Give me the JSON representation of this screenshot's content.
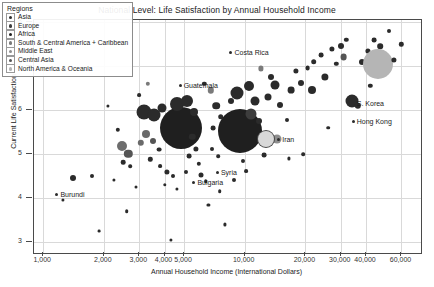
{
  "chart_data": {
    "type": "scatter",
    "title": "National Level: Life Satisfaction by Annual Household Income",
    "xlabel": "Annual Household Income (International Dollars)",
    "ylabel": "Current Life Satisfaction",
    "xscale": "log",
    "xlim": [
      900,
      75000
    ],
    "ylim": [
      2.75,
      8.05
    ],
    "grid": true,
    "legend_position": "top-left",
    "legend_title": "Regions",
    "xticks": [
      {
        "value": 1000,
        "label": "1,000"
      },
      {
        "value": 2000,
        "label": "2,000"
      },
      {
        "value": 3000,
        "label": "3,000"
      },
      {
        "value": 4000,
        "label": "4,000"
      },
      {
        "value": 5000,
        "label": "5,000"
      },
      {
        "value": 10000,
        "label": "10,000"
      },
      {
        "value": 20000,
        "label": "20,000"
      },
      {
        "value": 30000,
        "label": "30,000"
      },
      {
        "value": 40000,
        "label": "40,000"
      },
      {
        "value": 60000,
        "label": "60,000"
      }
    ],
    "yticks": [
      {
        "value": 3,
        "label": "3"
      },
      {
        "value": 4,
        "label": "4"
      },
      {
        "value": 5,
        "label": "5"
      },
      {
        "value": 6,
        "label": "6"
      },
      {
        "value": 7,
        "label": "7"
      },
      {
        "value": 8,
        "label": "8"
      }
    ],
    "series": [
      {
        "name": "Asia",
        "color": "#2b2b2b"
      },
      {
        "name": "Europe",
        "color": "#3d3d3d"
      },
      {
        "name": "Africa",
        "color": "#1f1f1f"
      },
      {
        "name": "South & Central America + Caribbean",
        "color": "#7a7a7a"
      },
      {
        "name": "Middle East",
        "color": "#8d8d8d"
      },
      {
        "name": "Central Asia",
        "color": "#555555"
      },
      {
        "name": "North America & Oceania",
        "color": "#b5b5b5"
      }
    ],
    "annotations": [
      {
        "label": "Costa Rica",
        "x": 8400,
        "y": 7.3
      },
      {
        "label": "Guatemala",
        "x": 4700,
        "y": 6.55
      },
      {
        "label": "S. Korea",
        "x": 34000,
        "y": 6.15
      },
      {
        "label": "Hong Kong",
        "x": 34000,
        "y": 5.72
      },
      {
        "label": "Iran",
        "x": 14500,
        "y": 5.32
      },
      {
        "label": "Syria",
        "x": 7200,
        "y": 4.56
      },
      {
        "label": "Bulgaria",
        "x": 5500,
        "y": 4.35
      },
      {
        "label": "Burundi",
        "x": 1150,
        "y": 4.08
      }
    ],
    "points": [
      {
        "x": 1400,
        "y": 4.45,
        "r": 3.0,
        "c": "#2b2b2b"
      },
      {
        "x": 1750,
        "y": 4.5,
        "r": 2.0,
        "c": "#2b2b2b"
      },
      {
        "x": 1250,
        "y": 3.95,
        "r": 1.6,
        "c": "#2b2b2b"
      },
      {
        "x": 2350,
        "y": 5.55,
        "r": 2.2,
        "c": "#2b2b2b"
      },
      {
        "x": 2450,
        "y": 5.18,
        "r": 5.0,
        "c": "#6d6d6d"
      },
      {
        "x": 2650,
        "y": 5.0,
        "r": 4.2,
        "c": "#555555"
      },
      {
        "x": 2500,
        "y": 4.82,
        "r": 2.3,
        "c": "#2b2b2b"
      },
      {
        "x": 2700,
        "y": 4.72,
        "r": 1.8,
        "c": "#2b2b2b"
      },
      {
        "x": 2250,
        "y": 4.42,
        "r": 1.6,
        "c": "#2b2b2b"
      },
      {
        "x": 2900,
        "y": 4.25,
        "r": 1.5,
        "c": "#2b2b2b"
      },
      {
        "x": 2600,
        "y": 3.7,
        "r": 1.8,
        "c": "#2b2b2b"
      },
      {
        "x": 2100,
        "y": 6.1,
        "r": 1.6,
        "c": "#2b2b2b"
      },
      {
        "x": 3000,
        "y": 6.35,
        "r": 1.9,
        "c": "#2b2b2b"
      },
      {
        "x": 3300,
        "y": 6.6,
        "r": 2.2,
        "c": "#7a7a7a"
      },
      {
        "x": 3150,
        "y": 5.95,
        "r": 7.5,
        "c": "#2b2b2b"
      },
      {
        "x": 3550,
        "y": 5.9,
        "r": 6.5,
        "c": "#2b2b2b"
      },
      {
        "x": 3900,
        "y": 6.05,
        "r": 4.5,
        "c": "#2b2b2b"
      },
      {
        "x": 3250,
        "y": 5.45,
        "r": 4.0,
        "c": "#6a6a6a"
      },
      {
        "x": 3050,
        "y": 5.25,
        "r": 3.2,
        "c": "#6a6a6a"
      },
      {
        "x": 3500,
        "y": 5.3,
        "r": 3.0,
        "c": "#555555"
      },
      {
        "x": 3750,
        "y": 5.1,
        "r": 2.4,
        "c": "#2b2b2b"
      },
      {
        "x": 3400,
        "y": 4.88,
        "r": 2.2,
        "c": "#2b2b2b"
      },
      {
        "x": 3800,
        "y": 4.72,
        "r": 1.9,
        "c": "#2b2b2b"
      },
      {
        "x": 4100,
        "y": 4.6,
        "r": 2.6,
        "c": "#2b2b2b"
      },
      {
        "x": 4400,
        "y": 4.5,
        "r": 2.0,
        "c": "#2b2b2b"
      },
      {
        "x": 4000,
        "y": 4.3,
        "r": 1.7,
        "c": "#2b2b2b"
      },
      {
        "x": 4600,
        "y": 4.2,
        "r": 1.6,
        "c": "#2b2b2b"
      },
      {
        "x": 4850,
        "y": 5.6,
        "r": 21.0,
        "c": "#1f1f1f"
      },
      {
        "x": 4600,
        "y": 6.15,
        "r": 7.0,
        "c": "#2b2b2b"
      },
      {
        "x": 5200,
        "y": 6.2,
        "r": 6.0,
        "c": "#2b2b2b"
      },
      {
        "x": 5600,
        "y": 5.95,
        "r": 4.0,
        "c": "#2b2b2b"
      },
      {
        "x": 5500,
        "y": 5.4,
        "r": 3.2,
        "c": "#2b2b2b"
      },
      {
        "x": 5700,
        "y": 5.12,
        "r": 2.6,
        "c": "#2b2b2b"
      },
      {
        "x": 5300,
        "y": 4.95,
        "r": 2.4,
        "c": "#2b2b2b"
      },
      {
        "x": 5900,
        "y": 4.78,
        "r": 2.2,
        "c": "#2b2b2b"
      },
      {
        "x": 5100,
        "y": 4.6,
        "r": 2.0,
        "c": "#2b2b2b"
      },
      {
        "x": 6100,
        "y": 4.52,
        "r": 2.5,
        "c": "#2b2b2b"
      },
      {
        "x": 6400,
        "y": 4.38,
        "r": 1.8,
        "c": "#2b2b2b"
      },
      {
        "x": 6800,
        "y": 6.45,
        "r": 3.2,
        "c": "#7a7a7a"
      },
      {
        "x": 6300,
        "y": 6.6,
        "r": 2.2,
        "c": "#2b2b2b"
      },
      {
        "x": 7200,
        "y": 6.1,
        "r": 3.8,
        "c": "#2b2b2b"
      },
      {
        "x": 7600,
        "y": 5.85,
        "r": 2.8,
        "c": "#2b2b2b"
      },
      {
        "x": 7000,
        "y": 5.6,
        "r": 2.4,
        "c": "#2b2b2b"
      },
      {
        "x": 7900,
        "y": 5.35,
        "r": 2.2,
        "c": "#2b2b2b"
      },
      {
        "x": 6900,
        "y": 5.12,
        "r": 2.0,
        "c": "#2b2b2b"
      },
      {
        "x": 7400,
        "y": 4.95,
        "r": 1.8,
        "c": "#2b2b2b"
      },
      {
        "x": 9500,
        "y": 5.52,
        "r": 22.0,
        "c": "#1f1f1f"
      },
      {
        "x": 9200,
        "y": 6.4,
        "r": 6.5,
        "c": "#2b2b2b"
      },
      {
        "x": 10500,
        "y": 6.55,
        "r": 5.0,
        "c": "#2b2b2b"
      },
      {
        "x": 8600,
        "y": 6.2,
        "r": 3.0,
        "c": "#2b2b2b"
      },
      {
        "x": 11200,
        "y": 6.2,
        "r": 4.5,
        "c": "#2b2b2b"
      },
      {
        "x": 10800,
        "y": 5.92,
        "r": 5.5,
        "c": "#3d3d3d"
      },
      {
        "x": 11800,
        "y": 5.75,
        "r": 3.0,
        "c": "#2b2b2b"
      },
      {
        "x": 9800,
        "y": 4.85,
        "r": 2.0,
        "c": "#2b2b2b"
      },
      {
        "x": 10200,
        "y": 4.62,
        "r": 1.9,
        "c": "#2b2b2b"
      },
      {
        "x": 8800,
        "y": 4.42,
        "r": 2.0,
        "c": "#2b2b2b"
      },
      {
        "x": 12500,
        "y": 4.98,
        "r": 2.4,
        "c": "#2b2b2b"
      },
      {
        "x": 12000,
        "y": 6.95,
        "r": 2.6,
        "c": "#7a7a7a"
      },
      {
        "x": 13500,
        "y": 6.75,
        "r": 3.0,
        "c": "#2b2b2b"
      },
      {
        "x": 14200,
        "y": 6.58,
        "r": 4.5,
        "c": "#2b2b2b"
      },
      {
        "x": 13000,
        "y": 6.3,
        "r": 3.5,
        "c": "#2b2b2b"
      },
      {
        "x": 15000,
        "y": 6.12,
        "r": 3.0,
        "c": "#2b2b2b"
      },
      {
        "x": 14500,
        "y": 5.35,
        "r": 4.5,
        "c": "#8d8d8d"
      },
      {
        "x": 16200,
        "y": 5.78,
        "r": 2.0,
        "c": "#2b2b2b"
      },
      {
        "x": 17000,
        "y": 6.45,
        "r": 3.4,
        "c": "#2b2b2b"
      },
      {
        "x": 18000,
        "y": 6.9,
        "r": 2.6,
        "c": "#2b2b2b"
      },
      {
        "x": 19000,
        "y": 6.62,
        "r": 3.0,
        "c": "#2b2b2b"
      },
      {
        "x": 20500,
        "y": 6.95,
        "r": 2.4,
        "c": "#2b2b2b"
      },
      {
        "x": 22000,
        "y": 7.1,
        "r": 2.8,
        "c": "#2b2b2b"
      },
      {
        "x": 24000,
        "y": 7.25,
        "r": 2.4,
        "c": "#2b2b2b"
      },
      {
        "x": 21500,
        "y": 6.45,
        "r": 4.0,
        "c": "#2b2b2b"
      },
      {
        "x": 25000,
        "y": 6.75,
        "r": 3.6,
        "c": "#2b2b2b"
      },
      {
        "x": 27000,
        "y": 7.4,
        "r": 2.6,
        "c": "#2b2b2b"
      },
      {
        "x": 28500,
        "y": 7.05,
        "r": 2.2,
        "c": "#2b2b2b"
      },
      {
        "x": 30000,
        "y": 7.45,
        "r": 3.0,
        "c": "#2b2b2b"
      },
      {
        "x": 32000,
        "y": 7.6,
        "r": 2.2,
        "c": "#2b2b2b"
      },
      {
        "x": 31000,
        "y": 7.2,
        "r": 3.4,
        "c": "#555555"
      },
      {
        "x": 34000,
        "y": 6.2,
        "r": 6.5,
        "c": "#2b2b2b"
      },
      {
        "x": 36500,
        "y": 6.1,
        "r": 3.2,
        "c": "#2b2b2b"
      },
      {
        "x": 38000,
        "y": 7.1,
        "r": 3.0,
        "c": "#2b2b2b"
      },
      {
        "x": 41000,
        "y": 7.35,
        "r": 2.6,
        "c": "#2b2b2b"
      },
      {
        "x": 44000,
        "y": 7.6,
        "r": 2.4,
        "c": "#2b2b2b"
      },
      {
        "x": 47000,
        "y": 7.45,
        "r": 2.8,
        "c": "#2b2b2b"
      },
      {
        "x": 52000,
        "y": 7.8,
        "r": 2.0,
        "c": "#2b2b2b"
      },
      {
        "x": 46000,
        "y": 7.05,
        "r": 15.0,
        "c": "#b5b5b5"
      },
      {
        "x": 55000,
        "y": 7.15,
        "r": 2.6,
        "c": "#2b2b2b"
      },
      {
        "x": 60000,
        "y": 7.5,
        "r": 2.2,
        "c": "#2b2b2b"
      },
      {
        "x": 42000,
        "y": 6.55,
        "r": 2.2,
        "c": "#2b2b2b"
      },
      {
        "x": 19500,
        "y": 5.0,
        "r": 1.8,
        "c": "#2b2b2b"
      },
      {
        "x": 16500,
        "y": 4.9,
        "r": 1.6,
        "c": "#2b2b2b"
      },
      {
        "x": 26000,
        "y": 5.6,
        "r": 1.8,
        "c": "#2b2b2b"
      },
      {
        "x": 8000,
        "y": 3.4,
        "r": 1.6,
        "c": "#2b2b2b"
      },
      {
        "x": 4300,
        "y": 3.05,
        "r": 1.6,
        "c": "#2b2b2b"
      },
      {
        "x": 1900,
        "y": 3.25,
        "r": 1.4,
        "c": "#2b2b2b"
      },
      {
        "x": 6600,
        "y": 3.85,
        "r": 1.6,
        "c": "#2b2b2b"
      },
      {
        "x": 7500,
        "y": 4.15,
        "r": 1.8,
        "c": "#2b2b2b"
      },
      {
        "x": 12800,
        "y": 5.35,
        "r": 9.0,
        "c": "#4a4a4a"
      },
      {
        "x": 12800,
        "y": 5.35,
        "r": 8.0,
        "c": "#d8d8d8"
      }
    ]
  }
}
